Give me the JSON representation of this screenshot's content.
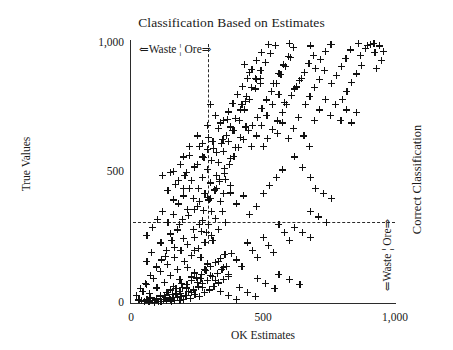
{
  "chart_data": {
    "type": "scatter",
    "title": "Classification Based on Estimates",
    "xlabel": "OK Estimates",
    "ylabel": "True Values",
    "xlim": [
      0,
      1000
    ],
    "ylim": [
      0,
      1000
    ],
    "xticks": [
      "0",
      "500",
      "1,000"
    ],
    "xtick_values": [
      0,
      500,
      1000
    ],
    "yticks": [
      "0",
      "500",
      "1,000"
    ],
    "ytick_values": [
      0,
      500,
      1000
    ],
    "grid": false,
    "marker": "plus",
    "marker_color": "#111111",
    "annotations": {
      "top_estimate_split": "⇐Waste ¦ Ore⇒",
      "right_true_split": "⇐Waste ¦ Ore⇒",
      "right_axis_title": "Correct Classification"
    },
    "threshold_lines": {
      "vertical_x": 290,
      "horizontal_y": 310,
      "style": "dashed"
    },
    "points": [
      [
        40,
        8
      ],
      [
        52,
        5
      ],
      [
        60,
        12
      ],
      [
        68,
        4
      ],
      [
        75,
        20
      ],
      [
        82,
        9
      ],
      [
        90,
        3
      ],
      [
        96,
        16
      ],
      [
        103,
        7
      ],
      [
        110,
        25
      ],
      [
        115,
        5
      ],
      [
        122,
        14
      ],
      [
        128,
        30
      ],
      [
        133,
        8
      ],
      [
        140,
        42
      ],
      [
        146,
        18
      ],
      [
        152,
        6
      ],
      [
        158,
        33
      ],
      [
        164,
        11
      ],
      [
        170,
        55
      ],
      [
        176,
        22
      ],
      [
        182,
        9
      ],
      [
        188,
        38
      ],
      [
        194,
        60
      ],
      [
        200,
        15
      ],
      [
        206,
        28
      ],
      [
        212,
        70
      ],
      [
        218,
        44
      ],
      [
        224,
        19
      ],
      [
        230,
        85
      ],
      [
        236,
        52
      ],
      [
        242,
        33
      ],
      [
        248,
        96
      ],
      [
        254,
        62
      ],
      [
        260,
        24
      ],
      [
        266,
        110
      ],
      [
        272,
        75
      ],
      [
        278,
        41
      ],
      [
        284,
        125
      ],
      [
        290,
        88
      ],
      [
        296,
        50
      ],
      [
        302,
        140
      ],
      [
        308,
        101
      ],
      [
        314,
        64
      ],
      [
        320,
        155
      ],
      [
        326,
        113
      ],
      [
        332,
        77
      ],
      [
        338,
        170
      ],
      [
        344,
        128
      ],
      [
        350,
        90
      ],
      [
        356,
        185
      ],
      [
        362,
        141
      ],
      [
        368,
        102
      ],
      [
        45,
        45
      ],
      [
        58,
        72
      ],
      [
        70,
        38
      ],
      [
        85,
        95
      ],
      [
        98,
        58
      ],
      [
        112,
        120
      ],
      [
        125,
        80
      ],
      [
        138,
        148
      ],
      [
        150,
        105
      ],
      [
        163,
        175
      ],
      [
        176,
        130
      ],
      [
        189,
        200
      ],
      [
        202,
        158
      ],
      [
        215,
        225
      ],
      [
        228,
        182
      ],
      [
        241,
        250
      ],
      [
        254,
        208
      ],
      [
        267,
        275
      ],
      [
        280,
        232
      ],
      [
        293,
        300
      ],
      [
        306,
        258
      ],
      [
        319,
        325
      ],
      [
        332,
        282
      ],
      [
        345,
        350
      ],
      [
        358,
        308
      ],
      [
        60,
        160
      ],
      [
        78,
        195
      ],
      [
        95,
        140
      ],
      [
        113,
        230
      ],
      [
        130,
        178
      ],
      [
        148,
        265
      ],
      [
        165,
        212
      ],
      [
        183,
        300
      ],
      [
        200,
        248
      ],
      [
        218,
        335
      ],
      [
        235,
        282
      ],
      [
        253,
        370
      ],
      [
        270,
        318
      ],
      [
        288,
        405
      ],
      [
        305,
        352
      ],
      [
        323,
        440
      ],
      [
        340,
        388
      ],
      [
        358,
        475
      ],
      [
        375,
        422
      ],
      [
        150,
        500
      ],
      [
        168,
        455
      ],
      [
        186,
        530
      ],
      [
        204,
        488
      ],
      [
        222,
        565
      ],
      [
        240,
        522
      ],
      [
        258,
        600
      ],
      [
        276,
        558
      ],
      [
        294,
        635
      ],
      [
        312,
        592
      ],
      [
        330,
        670
      ],
      [
        348,
        628
      ],
      [
        366,
        705
      ],
      [
        384,
        662
      ],
      [
        270,
        480
      ],
      [
        288,
        512
      ],
      [
        306,
        545
      ],
      [
        324,
        578
      ],
      [
        342,
        610
      ],
      [
        360,
        642
      ],
      [
        378,
        675
      ],
      [
        396,
        708
      ],
      [
        414,
        740
      ],
      [
        432,
        772
      ],
      [
        300,
        400
      ],
      [
        318,
        432
      ],
      [
        336,
        465
      ],
      [
        354,
        498
      ],
      [
        372,
        530
      ],
      [
        390,
        562
      ],
      [
        408,
        595
      ],
      [
        426,
        628
      ],
      [
        444,
        660
      ],
      [
        350,
        700
      ],
      [
        368,
        732
      ],
      [
        386,
        765
      ],
      [
        404,
        798
      ],
      [
        422,
        830
      ],
      [
        440,
        862
      ],
      [
        458,
        895
      ],
      [
        476,
        928
      ],
      [
        494,
        960
      ],
      [
        420,
        760
      ],
      [
        438,
        792
      ],
      [
        456,
        825
      ],
      [
        474,
        858
      ],
      [
        492,
        890
      ],
      [
        510,
        922
      ],
      [
        528,
        955
      ],
      [
        546,
        988
      ],
      [
        460,
        680
      ],
      [
        478,
        712
      ],
      [
        496,
        745
      ],
      [
        514,
        778
      ],
      [
        532,
        810
      ],
      [
        550,
        842
      ],
      [
        568,
        875
      ],
      [
        586,
        908
      ],
      [
        604,
        940
      ],
      [
        500,
        600
      ],
      [
        518,
        632
      ],
      [
        536,
        665
      ],
      [
        554,
        698
      ],
      [
        572,
        730
      ],
      [
        590,
        762
      ],
      [
        608,
        795
      ],
      [
        626,
        828
      ],
      [
        644,
        860
      ],
      [
        560,
        880
      ],
      [
        578,
        912
      ],
      [
        596,
        945
      ],
      [
        614,
        978
      ],
      [
        620,
        820
      ],
      [
        638,
        852
      ],
      [
        656,
        885
      ],
      [
        674,
        918
      ],
      [
        692,
        950
      ],
      [
        700,
        900
      ],
      [
        718,
        932
      ],
      [
        736,
        965
      ],
      [
        754,
        990
      ],
      [
        660,
        760
      ],
      [
        678,
        792
      ],
      [
        696,
        825
      ],
      [
        714,
        858
      ],
      [
        732,
        890
      ],
      [
        760,
        840
      ],
      [
        778,
        872
      ],
      [
        796,
        905
      ],
      [
        814,
        938
      ],
      [
        832,
        970
      ],
      [
        800,
        780
      ],
      [
        818,
        812
      ],
      [
        836,
        845
      ],
      [
        854,
        878
      ],
      [
        872,
        910
      ],
      [
        870,
        950
      ],
      [
        888,
        975
      ],
      [
        906,
        990
      ],
      [
        924,
        960
      ],
      [
        930,
        900
      ],
      [
        948,
        930
      ],
      [
        955,
        965
      ],
      [
        940,
        985
      ],
      [
        520,
        990
      ],
      [
        600,
        995
      ],
      [
        680,
        985
      ],
      [
        760,
        990
      ],
      [
        860,
        995
      ],
      [
        895,
        988
      ],
      [
        920,
        995
      ],
      [
        430,
        915
      ],
      [
        450,
        885
      ],
      [
        470,
        860
      ],
      [
        490,
        840
      ],
      [
        540,
        840
      ],
      [
        560,
        800
      ],
      [
        580,
        770
      ],
      [
        300,
        760
      ],
      [
        320,
        720
      ],
      [
        340,
        690
      ],
      [
        250,
        640
      ],
      [
        270,
        610
      ],
      [
        290,
        680
      ],
      [
        200,
        560
      ],
      [
        220,
        600
      ],
      [
        240,
        520
      ],
      [
        160,
        505
      ],
      [
        180,
        470
      ],
      [
        200,
        440
      ],
      [
        120,
        490
      ],
      [
        140,
        430
      ],
      [
        160,
        395
      ],
      [
        620,
        560
      ],
      [
        650,
        520
      ],
      [
        680,
        480
      ],
      [
        700,
        440
      ],
      [
        730,
        420
      ],
      [
        760,
        400
      ],
      [
        680,
        350
      ],
      [
        710,
        330
      ],
      [
        740,
        310
      ],
      [
        620,
        290
      ],
      [
        650,
        270
      ],
      [
        680,
        250
      ],
      [
        560,
        300
      ],
      [
        580,
        270
      ],
      [
        600,
        240
      ],
      [
        500,
        250
      ],
      [
        520,
        220
      ],
      [
        540,
        195
      ],
      [
        440,
        230
      ],
      [
        460,
        200
      ],
      [
        480,
        175
      ],
      [
        380,
        190
      ],
      [
        400,
        165
      ],
      [
        420,
        140
      ],
      [
        330,
        160
      ],
      [
        350,
        135
      ],
      [
        370,
        110
      ],
      [
        280,
        130
      ],
      [
        300,
        105
      ],
      [
        320,
        85
      ],
      [
        230,
        100
      ],
      [
        250,
        80
      ],
      [
        270,
        60
      ],
      [
        190,
        75
      ],
      [
        210,
        58
      ],
      [
        230,
        42
      ],
      [
        150,
        50
      ],
      [
        170,
        35
      ],
      [
        190,
        25
      ],
      [
        110,
        30
      ],
      [
        130,
        20
      ],
      [
        150,
        12
      ],
      [
        70,
        18
      ],
      [
        90,
        10
      ],
      [
        110,
        5
      ],
      [
        30,
        12
      ],
      [
        50,
        6
      ],
      [
        20,
        30
      ],
      [
        35,
        55
      ],
      [
        55,
        75
      ],
      [
        75,
        105
      ],
      [
        95,
        135
      ],
      [
        115,
        165
      ],
      [
        135,
        200
      ],
      [
        155,
        240
      ],
      [
        175,
        280
      ],
      [
        195,
        320
      ],
      [
        215,
        360
      ],
      [
        235,
        400
      ],
      [
        255,
        440
      ],
      [
        275,
        355
      ],
      [
        295,
        395
      ],
      [
        315,
        435
      ],
      [
        335,
        475
      ],
      [
        355,
        515
      ],
      [
        375,
        555
      ],
      [
        395,
        595
      ],
      [
        415,
        635
      ],
      [
        435,
        675
      ],
      [
        455,
        600
      ],
      [
        475,
        640
      ],
      [
        495,
        680
      ],
      [
        515,
        720
      ],
      [
        535,
        760
      ],
      [
        555,
        650
      ],
      [
        575,
        690
      ],
      [
        595,
        630
      ],
      [
        615,
        670
      ],
      [
        635,
        710
      ],
      [
        655,
        640
      ],
      [
        675,
        600
      ],
      [
        695,
        700
      ],
      [
        715,
        740
      ],
      [
        735,
        780
      ],
      [
        755,
        720
      ],
      [
        775,
        760
      ],
      [
        795,
        700
      ],
      [
        815,
        740
      ],
      [
        835,
        690
      ],
      [
        855,
        730
      ],
      [
        260,
        300
      ],
      [
        285,
        270
      ],
      [
        310,
        240
      ],
      [
        240,
        200
      ],
      [
        265,
        175
      ],
      [
        290,
        150
      ],
      [
        215,
        135
      ],
      [
        240,
        115
      ],
      [
        265,
        95
      ],
      [
        185,
        90
      ],
      [
        210,
        70
      ],
      [
        235,
        50
      ],
      [
        160,
        65
      ],
      [
        185,
        45
      ],
      [
        210,
        28
      ],
      [
        135,
        40
      ],
      [
        160,
        22
      ],
      [
        185,
        10
      ],
      [
        410,
        60
      ],
      [
        440,
        40
      ],
      [
        470,
        25
      ],
      [
        340,
        45
      ],
      [
        370,
        28
      ],
      [
        400,
        15
      ],
      [
        560,
        110
      ],
      [
        600,
        90
      ],
      [
        640,
        70
      ],
      [
        480,
        95
      ],
      [
        510,
        75
      ],
      [
        545,
        55
      ],
      [
        300,
        460
      ],
      [
        325,
        490
      ],
      [
        350,
        420
      ],
      [
        375,
        450
      ],
      [
        400,
        380
      ],
      [
        425,
        410
      ],
      [
        450,
        340
      ],
      [
        475,
        370
      ],
      [
        500,
        420
      ],
      [
        525,
        450
      ],
      [
        550,
        480
      ],
      [
        575,
        510
      ],
      [
        210,
        500
      ],
      [
        230,
        470
      ],
      [
        250,
        530
      ],
      [
        270,
        560
      ],
      [
        290,
        590
      ],
      [
        310,
        620
      ],
      [
        330,
        540
      ],
      [
        350,
        580
      ],
      [
        370,
        620
      ],
      [
        390,
        660
      ],
      [
        410,
        700
      ],
      [
        430,
        740
      ],
      [
        450,
        780
      ],
      [
        470,
        820
      ],
      [
        490,
        860
      ],
      [
        60,
        260
      ],
      [
        80,
        290
      ],
      [
        100,
        320
      ],
      [
        120,
        350
      ],
      [
        140,
        310
      ],
      [
        160,
        340
      ],
      [
        180,
        380
      ],
      [
        200,
        410
      ],
      [
        220,
        440
      ],
      [
        240,
        360
      ],
      [
        260,
        390
      ],
      [
        280,
        420
      ]
    ]
  }
}
